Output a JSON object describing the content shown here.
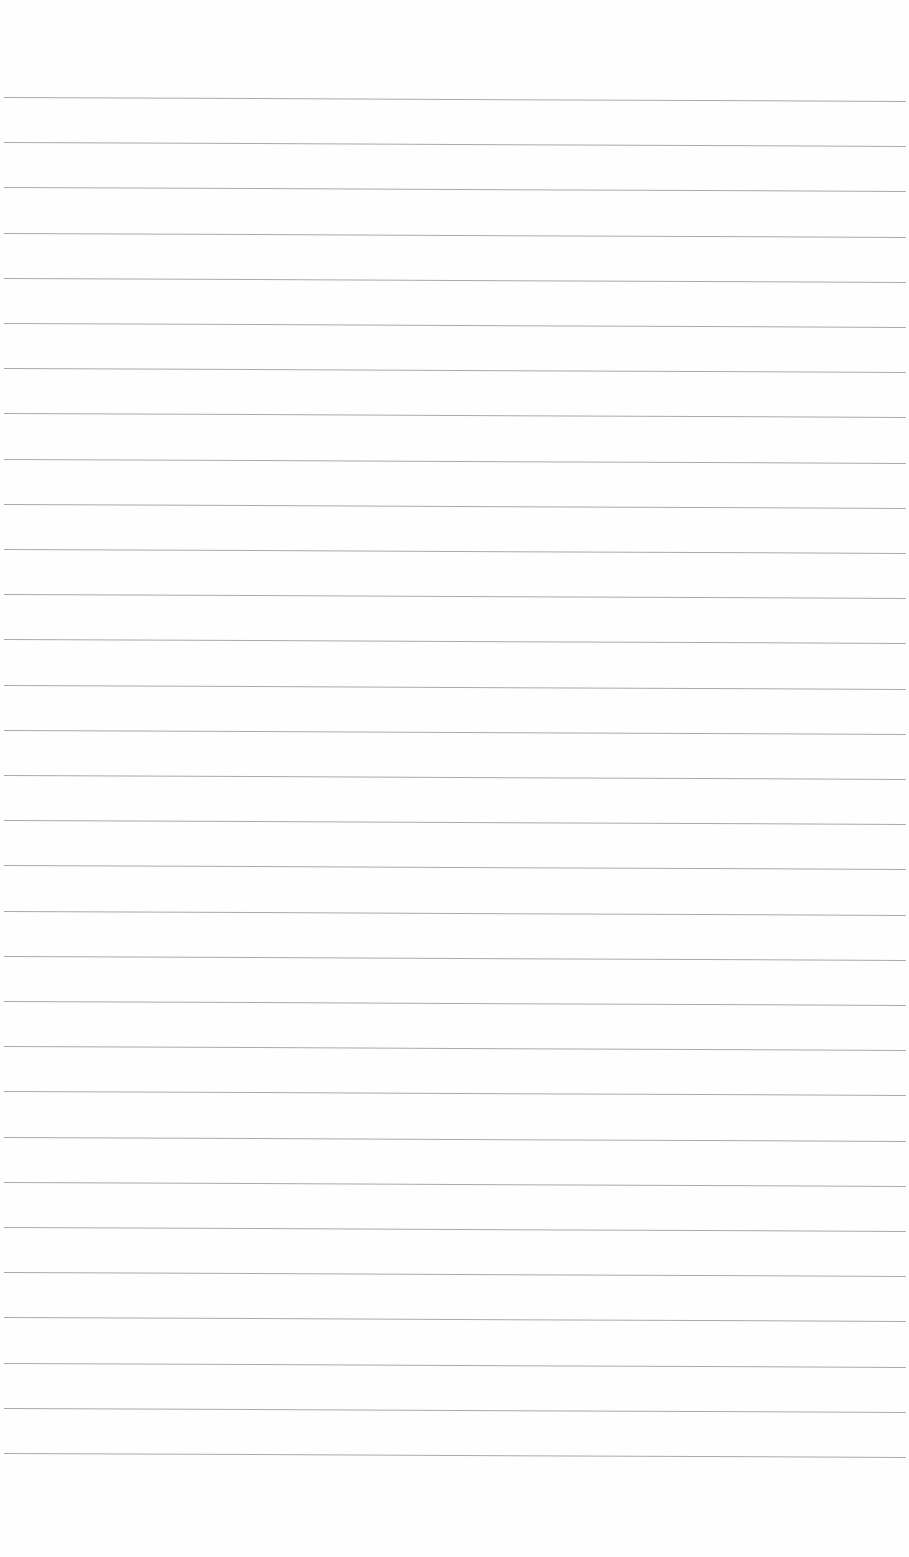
{
  "page": {
    "type": "lined-paper",
    "background_color": "#fefefe",
    "line_color": "#9a9a9a",
    "line_count": 31,
    "first_line_y": 97,
    "line_spacing": 45.2,
    "line_left": 4,
    "line_right": 906,
    "text_content": []
  }
}
